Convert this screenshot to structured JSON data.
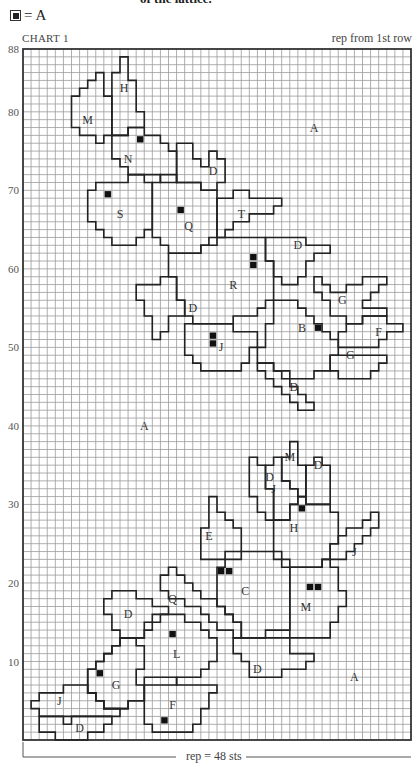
{
  "header": {
    "top_text": "of the lattice.",
    "legend_symbol": "filled-square",
    "legend_label": "= A",
    "chart_title": "CHART 1",
    "rep_note": "rep from 1st row"
  },
  "footer": {
    "rep_label": "rep = 48 sts"
  },
  "grid": {
    "columns": 48,
    "rows": 88,
    "row_labels": [
      10,
      20,
      30,
      40,
      50,
      60,
      70,
      80,
      88
    ]
  },
  "chart_data": {
    "type": "table",
    "title": "CHART 1",
    "columns": 48,
    "rows": 88,
    "ylabel_ticks": [
      10,
      20,
      30,
      40,
      50,
      60,
      70,
      80,
      88
    ],
    "legend": [
      {
        "symbol": "filled square",
        "meaning": "A"
      }
    ],
    "background_color_label": "A",
    "region_labels": [
      {
        "label": "H",
        "col": 12.5,
        "row": 83
      },
      {
        "label": "M",
        "col": 8,
        "row": 79
      },
      {
        "label": "N",
        "col": 13,
        "row": 74
      },
      {
        "label": "A",
        "col": 36,
        "row": 78
      },
      {
        "label": "D",
        "col": 23.5,
        "row": 72.5
      },
      {
        "label": "S",
        "col": 12,
        "row": 67
      },
      {
        "label": "Q",
        "col": 20.5,
        "row": 65.5
      },
      {
        "label": "T",
        "col": 27,
        "row": 67
      },
      {
        "label": "D",
        "col": 34,
        "row": 63
      },
      {
        "label": "R",
        "col": 26,
        "row": 58
      },
      {
        "label": "D",
        "col": 21,
        "row": 55
      },
      {
        "label": "G",
        "col": 39.5,
        "row": 56
      },
      {
        "label": "F",
        "col": 44,
        "row": 52
      },
      {
        "label": "B",
        "col": 34.5,
        "row": 52.5
      },
      {
        "label": "J",
        "col": 24.5,
        "row": 50
      },
      {
        "label": "G",
        "col": 40.5,
        "row": 49
      },
      {
        "label": "D",
        "col": 33.5,
        "row": 45
      },
      {
        "label": "A",
        "col": 15,
        "row": 40
      },
      {
        "label": "M",
        "col": 33,
        "row": 36
      },
      {
        "label": "D",
        "col": 36.5,
        "row": 35
      },
      {
        "label": "D",
        "col": 30.5,
        "row": 33.5
      },
      {
        "label": "J",
        "col": 31,
        "row": 32
      },
      {
        "label": "E",
        "col": 23,
        "row": 26
      },
      {
        "label": "H",
        "col": 33.5,
        "row": 27
      },
      {
        "label": "J",
        "col": 41,
        "row": 24
      },
      {
        "label": "Q",
        "col": 18.5,
        "row": 18
      },
      {
        "label": "C",
        "col": 27.5,
        "row": 19
      },
      {
        "label": "M",
        "col": 35,
        "row": 17
      },
      {
        "label": "D",
        "col": 13,
        "row": 16
      },
      {
        "label": "L",
        "col": 19,
        "row": 11
      },
      {
        "label": "D",
        "col": 29,
        "row": 9
      },
      {
        "label": "A",
        "col": 41,
        "row": 8
      },
      {
        "label": "G",
        "col": 11.5,
        "row": 7
      },
      {
        "label": "J",
        "col": 4.5,
        "row": 5
      },
      {
        "label": "F",
        "col": 18.5,
        "row": 4.5
      },
      {
        "label": "D",
        "col": 7,
        "row": 1.5
      }
    ],
    "filled_squares_A": [
      [
        14,
        76
      ],
      [
        10,
        69
      ],
      [
        19,
        67
      ],
      [
        28,
        61
      ],
      [
        28,
        60
      ],
      [
        36,
        52
      ],
      [
        23,
        51
      ],
      [
        23,
        50
      ],
      [
        34,
        29
      ],
      [
        24,
        21
      ],
      [
        25,
        21
      ],
      [
        35,
        19
      ],
      [
        36,
        19
      ],
      [
        18,
        13
      ],
      [
        9,
        8
      ],
      [
        17,
        2
      ]
    ],
    "repeat": "rep = 48 sts"
  }
}
